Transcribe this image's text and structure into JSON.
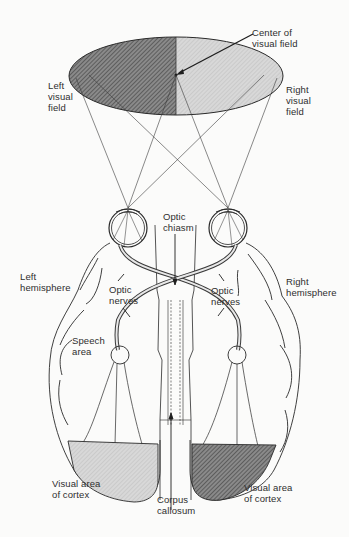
{
  "diagram": {
    "type": "anatomical-diagram",
    "colors": {
      "left_field_dark": "#6e6e6e",
      "right_field_light": "#cfcfcf",
      "line": "#2a2a2a",
      "background": "#fbfbfa"
    }
  },
  "labels": {
    "center_of_visual_field": "Center of\nvisual field",
    "left_visual_field": "Left\nvisual\nfield",
    "right_visual_field": "Right\nvisual\nfield",
    "optic_chiasm": "Optic\nchiasm",
    "left_hemisphere": "Left\nhemisphere",
    "right_hemisphere": "Right\nhemisphere",
    "optic_nerves_left": "Optic\nnerves",
    "optic_nerves_right": "Optic\nnerves",
    "speech_area": "Speech\narea",
    "visual_area_left": "Visual area\nof cortex",
    "visual_area_right": "Visual area\nof cortex",
    "corpus_callosum": "Corpus\ncallosum"
  }
}
